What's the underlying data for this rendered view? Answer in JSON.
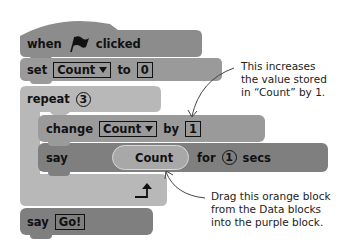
{
  "blocks": {
    "hat": {
      "when": "when",
      "icon": "green-flag-icon",
      "clicked": "clicked",
      "color": "#8c8c8c"
    },
    "set": {
      "label": "set",
      "variable": "Count",
      "to": "to",
      "value": "0",
      "color": "#9a9a9a"
    },
    "repeat": {
      "label": "repeat",
      "count": "3",
      "color": "#b8b8b8"
    },
    "change": {
      "label": "change",
      "variable": "Count",
      "by": "by",
      "value": "1",
      "color": "#9a9a9a"
    },
    "say_for": {
      "label": "say",
      "reporter": "Count",
      "for": "for",
      "seconds": "1",
      "secs": "secs",
      "color": "#7f7f7f",
      "reporter_color": "#a8a8a8"
    },
    "say": {
      "label": "say",
      "value": "Go!",
      "color": "#7f7f7f"
    }
  },
  "annotations": [
    {
      "lines": [
        "This increases",
        "the value stored",
        "in “Count” by 1."
      ]
    },
    {
      "lines": [
        "Drag this orange block",
        "from the Data blocks",
        "into the purple block."
      ]
    }
  ]
}
